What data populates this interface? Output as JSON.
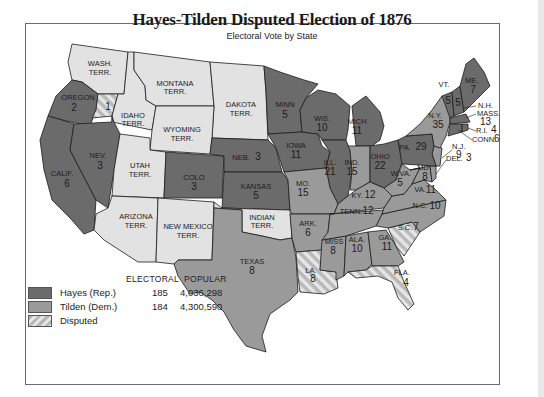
{
  "title": "Hayes-Tilden Disputed Election of 1876",
  "subtitle": "Electoral Vote by State",
  "colors": {
    "republican": "#6b6b6b",
    "democrat": "#9a9a9a",
    "territory": "#e2e2e2",
    "disputed_a": "#b8b8b8",
    "disputed_b": "#e6e6e6",
    "border": "#1c1c1c"
  },
  "legend": {
    "header_electoral": "ELECTORAL",
    "header_popular": "POPULAR",
    "rows": [
      {
        "name": "Hayes (Rep.)",
        "electoral": "185",
        "popular": "4,036,298",
        "swatch": "republican"
      },
      {
        "name": "Tilden (Dem.)",
        "electoral": "184",
        "popular": "4,300,590",
        "swatch": "democrat"
      },
      {
        "name": "Disputed",
        "electoral": "",
        "popular": "",
        "swatch": "disputed"
      }
    ]
  },
  "regions": {
    "wash": {
      "name": "WASH.",
      "sub": "TERR."
    },
    "oregon": {
      "name": "OREGON",
      "votes": "2",
      "disputed_votes": "1"
    },
    "idaho": {
      "name": "IDAHO",
      "sub": "TERR."
    },
    "montana": {
      "name": "MONTANA",
      "sub": "TERR."
    },
    "dakota": {
      "name": "DAKOTA",
      "sub": "TERR."
    },
    "wyoming": {
      "name": "WYOMING",
      "sub": "TERR."
    },
    "calif": {
      "name": "CALIF.",
      "votes": "6"
    },
    "nev": {
      "name": "NEV.",
      "votes": "3"
    },
    "utah": {
      "name": "UTAH",
      "sub": "TERR."
    },
    "colo": {
      "name": "COLO",
      "votes": "3"
    },
    "arizona": {
      "name": "ARIZONA",
      "sub": "TERR."
    },
    "newmexico": {
      "name": "NEW MEXICO",
      "sub": "TERR."
    },
    "minn": {
      "name": "MINN",
      "votes": "5"
    },
    "neb": {
      "name": "NEB.",
      "votes": "3"
    },
    "kansas": {
      "name": "KANSAS",
      "votes": "5"
    },
    "indian": {
      "name": "INDIAN",
      "sub": "TERR."
    },
    "texas": {
      "name": "TEXAS",
      "votes": "8"
    },
    "iowa": {
      "name": "IOWA",
      "votes": "11"
    },
    "wis": {
      "name": "WIS.",
      "votes": "10"
    },
    "mich": {
      "name": "MICH",
      "votes": "11"
    },
    "ill": {
      "name": "ILL.",
      "votes": "21"
    },
    "ind": {
      "name": "IND.",
      "votes": "15"
    },
    "ohio": {
      "name": "OHIO",
      "votes": "22"
    },
    "mo": {
      "name": "MO.",
      "votes": "15"
    },
    "ark": {
      "name": "ARK.",
      "votes": "6"
    },
    "la": {
      "name": "LA.",
      "votes": "8"
    },
    "miss": {
      "name": "MISS",
      "votes": "8"
    },
    "ala": {
      "name": "ALA.",
      "votes": "10"
    },
    "ga": {
      "name": "GA.",
      "votes": "11"
    },
    "fla": {
      "name": "FLA.",
      "votes": "4"
    },
    "sc": {
      "name": "S.C.",
      "votes": "7"
    },
    "nc": {
      "name": "N.C.",
      "votes": "10"
    },
    "tenn": {
      "name": "TENN.",
      "votes": "12"
    },
    "ky": {
      "name": "KY.",
      "votes": "12"
    },
    "va": {
      "name": "VA.",
      "votes": "11"
    },
    "wva": {
      "name": "W.VA.",
      "votes": "5"
    },
    "md": {
      "name": "MD.",
      "votes": "8"
    },
    "del": {
      "name": "DEL.",
      "votes": "3"
    },
    "nj": {
      "name": "N.J.",
      "votes": "9"
    },
    "pa": {
      "name": "PA.",
      "votes": "29"
    },
    "ny": {
      "name": "N.Y.",
      "votes": "35"
    },
    "vt": {
      "name": "VT.",
      "votes": "5"
    },
    "nh": {
      "name": "N.H.",
      "votes": "5"
    },
    "me": {
      "name": "ME.",
      "votes": "7"
    },
    "mass": {
      "name": "MASS.",
      "votes": "13"
    },
    "ri": {
      "name": "R.I.",
      "votes": "4"
    },
    "conn": {
      "name": "CONN.",
      "votes": "6"
    }
  }
}
